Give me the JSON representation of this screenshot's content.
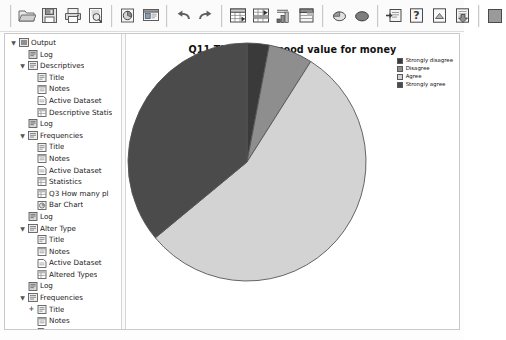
{
  "window": {
    "title": "Output Viewer"
  },
  "toolbar": {
    "buttons": [
      {
        "name": "open-file-button",
        "icon": "folder-open-icon",
        "label": "Open"
      },
      {
        "name": "save-button",
        "icon": "floppy-disk-icon",
        "label": "Save"
      },
      {
        "name": "print-button",
        "icon": "printer-icon",
        "label": "Print"
      },
      {
        "name": "print-preview-button",
        "icon": "print-preview-icon",
        "label": "Print Preview"
      },
      {
        "name": "export-button",
        "icon": "export-chart-icon",
        "label": "Export"
      },
      {
        "name": "dialog-recall-button",
        "icon": "dialog-recall-icon",
        "label": "Recall Dialogs"
      },
      {
        "name": "undo-button",
        "icon": "undo-arrow-icon",
        "label": "Undo"
      },
      {
        "name": "redo-button",
        "icon": "redo-arrow-icon",
        "label": "Redo"
      },
      {
        "name": "goto-data-button",
        "icon": "goto-data-icon",
        "label": "Go To Data"
      },
      {
        "name": "goto-case-button",
        "icon": "goto-case-icon",
        "label": "Go To Case"
      },
      {
        "name": "variables-button",
        "icon": "variables-icon",
        "label": "Variables"
      },
      {
        "name": "run-descriptives-button",
        "icon": "run-descriptives-icon",
        "label": "Descriptives"
      },
      {
        "name": "find-button",
        "icon": "magnifier-ball-icon",
        "label": "Find"
      },
      {
        "name": "select-cases-button",
        "icon": "select-cases-icon",
        "label": "Select Cases"
      },
      {
        "name": "insert-cases-button",
        "icon": "insert-cases-icon",
        "label": "Insert Cases"
      },
      {
        "name": "help-button",
        "icon": "question-mark-icon",
        "label": "Help"
      },
      {
        "name": "show-hide-button",
        "icon": "show-hide-icon",
        "label": "Show/Hide"
      },
      {
        "name": "promote-button",
        "icon": "promote-icon",
        "label": "Promote"
      },
      {
        "name": "stop-button",
        "icon": "stop-square-icon",
        "label": "Stop Processor"
      }
    ]
  },
  "tree": {
    "name": "output-navigation-tree",
    "nodes": [
      {
        "depth": 0,
        "toggle": "expanded",
        "icon": "output-root-icon",
        "label": "Output"
      },
      {
        "depth": 1,
        "toggle": "none",
        "icon": "log-icon",
        "label": "Log"
      },
      {
        "depth": 1,
        "toggle": "expanded",
        "icon": "output-item-icon",
        "label": "Descriptives"
      },
      {
        "depth": 2,
        "toggle": "none",
        "icon": "title-icon",
        "label": "Title"
      },
      {
        "depth": 2,
        "toggle": "none",
        "icon": "notes-icon",
        "label": "Notes"
      },
      {
        "depth": 2,
        "toggle": "none",
        "icon": "dataset-icon",
        "label": "Active Dataset"
      },
      {
        "depth": 2,
        "toggle": "none",
        "icon": "table-icon",
        "label": "Descriptive Statis"
      },
      {
        "depth": 1,
        "toggle": "none",
        "icon": "log-icon",
        "label": "Log"
      },
      {
        "depth": 1,
        "toggle": "expanded",
        "icon": "output-item-icon",
        "label": "Frequencies"
      },
      {
        "depth": 2,
        "toggle": "none",
        "icon": "title-icon",
        "label": "Title"
      },
      {
        "depth": 2,
        "toggle": "none",
        "icon": "notes-icon",
        "label": "Notes"
      },
      {
        "depth": 2,
        "toggle": "none",
        "icon": "dataset-icon",
        "label": "Active Dataset"
      },
      {
        "depth": 2,
        "toggle": "none",
        "icon": "table-icon",
        "label": "Statistics"
      },
      {
        "depth": 2,
        "toggle": "none",
        "icon": "table-icon",
        "label": "Q3 How many pl"
      },
      {
        "depth": 2,
        "toggle": "none",
        "icon": "chart-icon",
        "label": "Bar Chart"
      },
      {
        "depth": 1,
        "toggle": "none",
        "icon": "log-icon",
        "label": "Log"
      },
      {
        "depth": 1,
        "toggle": "expanded",
        "icon": "output-item-icon",
        "label": "Alter Type"
      },
      {
        "depth": 2,
        "toggle": "none",
        "icon": "title-icon",
        "label": "Title"
      },
      {
        "depth": 2,
        "toggle": "none",
        "icon": "notes-icon",
        "label": "Notes"
      },
      {
        "depth": 2,
        "toggle": "none",
        "icon": "dataset-icon",
        "label": "Active Dataset"
      },
      {
        "depth": 2,
        "toggle": "none",
        "icon": "table-icon",
        "label": "Altered Types"
      },
      {
        "depth": 1,
        "toggle": "none",
        "icon": "log-icon",
        "label": "Log"
      },
      {
        "depth": 1,
        "toggle": "expanded",
        "icon": "output-item-icon",
        "label": "Frequencies"
      },
      {
        "depth": 2,
        "toggle": "collapsed",
        "icon": "title-icon",
        "label": "Title"
      },
      {
        "depth": 2,
        "toggle": "none",
        "icon": "notes-icon",
        "label": "Notes"
      },
      {
        "depth": 2,
        "toggle": "none",
        "icon": "dataset-icon",
        "label": "Active Dataset"
      },
      {
        "depth": 2,
        "toggle": "none",
        "icon": "table-icon",
        "label": "Statistics"
      },
      {
        "depth": 2,
        "toggle": "none",
        "icon": "chart-icon",
        "label": "Pie Chart"
      }
    ]
  },
  "chart_data": {
    "type": "pie",
    "title": "Q11 The play is good value for money",
    "xlabel": "",
    "ylabel": "",
    "legend_position": "top-right",
    "grid": false,
    "start_angle": -90,
    "direction": "clockwise",
    "categories": [
      "Strongly disagree",
      "Disagree",
      "Agree",
      "Strongly agree"
    ],
    "values": [
      3,
      6,
      55,
      36
    ],
    "colors": [
      "#3a3a3a",
      "#8e8e8e",
      "#d3d3d3",
      "#4b4b4b"
    ],
    "slice_border": "#555555",
    "series": [
      {
        "name": "Q11 The play is good value for money",
        "values": [
          3,
          6,
          55,
          36
        ]
      }
    ],
    "legend": [
      {
        "label": "Strongly disagree",
        "color": "#3a3a3a"
      },
      {
        "label": "Disagree",
        "color": "#8e8e8e"
      },
      {
        "label": "Agree",
        "color": "#d3d3d3"
      },
      {
        "label": "Strongly agree",
        "color": "#4b4b4b"
      }
    ]
  }
}
